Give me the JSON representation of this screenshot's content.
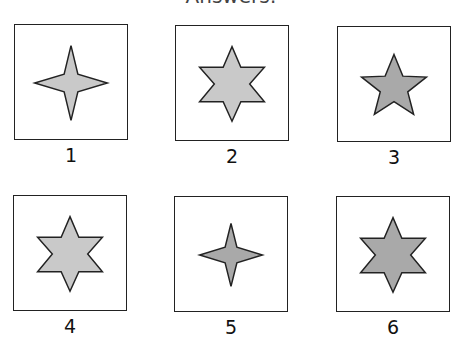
{
  "title": "Answers:",
  "colors": {
    "light_fill": "#c9c9c9",
    "dark_fill": "#a9a9a9",
    "stroke": "#222222"
  },
  "options": [
    {
      "label": "1",
      "shape": "4-point-star",
      "shade": "light",
      "size": "large"
    },
    {
      "label": "2",
      "shape": "6-point-star",
      "shade": "light",
      "size": "large"
    },
    {
      "label": "3",
      "shape": "5-point-star",
      "shade": "dark",
      "size": "medium"
    },
    {
      "label": "4",
      "shape": "6-point-star",
      "shade": "light",
      "size": "large"
    },
    {
      "label": "5",
      "shape": "4-point-star",
      "shade": "dark",
      "size": "medium"
    },
    {
      "label": "6",
      "shape": "6-point-star",
      "shade": "dark",
      "size": "large"
    }
  ]
}
